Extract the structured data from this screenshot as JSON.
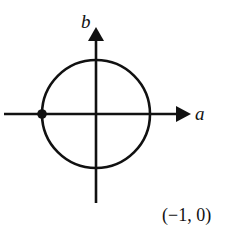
{
  "diagram": {
    "type": "complex-plane-unit-circle",
    "axes": {
      "horizontal_label": "a",
      "vertical_label": "b"
    },
    "circle": {
      "center": [
        96,
        114
      ],
      "radius": 54
    },
    "highlighted_point": {
      "label": "(−1, 0)",
      "coords": [
        -1,
        0
      ]
    },
    "colors": {
      "stroke": "#111111",
      "background": "#ffffff"
    }
  }
}
